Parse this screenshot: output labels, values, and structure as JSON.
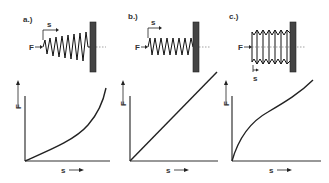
{
  "panels": [
    {
      "label": "a.)",
      "force_label": "F",
      "displacement_label": "s",
      "y_axis_label": "F",
      "x_axis_label": "s",
      "spring_type": "conical-coil-spring",
      "curve": "progressive"
    },
    {
      "label": "b.)",
      "force_label": "F",
      "displacement_label": "s",
      "y_axis_label": "F",
      "x_axis_label": "s",
      "spring_type": "cylindrical-coil-spring",
      "curve": "linear"
    },
    {
      "label": "c.)",
      "force_label": "F",
      "displacement_label": "s",
      "y_axis_label": "F",
      "x_axis_label": "s",
      "spring_type": "disc-spring-stack",
      "curve": "degressive"
    }
  ],
  "colors": {
    "ink": "#222222",
    "wall": "#444444",
    "background": "#ffffff"
  }
}
